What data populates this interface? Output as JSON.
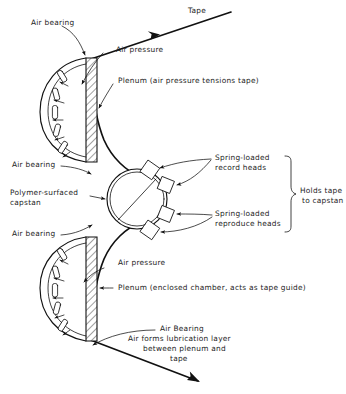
{
  "figure": {
    "background_color": "#ffffff",
    "ink_color": "#111111"
  },
  "labels": {
    "tape": "Tape",
    "air_bearing_top": "Air bearing",
    "air_pressure_top": "Air pressure",
    "plenum_top": "Plenum  (air pressure tensions tape)",
    "air_bearing_mid_upper": "Air bearing",
    "capstan": "Polymer-surfaced",
    "capstan_line2": "capstan",
    "air_bearing_mid_lower": "Air bearing",
    "record_heads_line1": "Spring-loaded",
    "record_heads_line2": "record heads",
    "reproduce_heads_line1": "Spring-loaded",
    "reproduce_heads_line2": "reproduce heads",
    "holds_tape_line1": "Holds tape",
    "holds_tape_line2": "to capstan",
    "air_pressure_bottom": "Air pressure",
    "plenum_bottom": "Plenum  (enclosed chamber, acts as tape guide)",
    "air_bearing_bottom_title": "Air Bearing",
    "air_bearing_bottom_l1": "Air forms lubrication layer",
    "air_bearing_bottom_l2": "between plenum and",
    "air_bearing_bottom_l3": "tape"
  },
  "components": {
    "upper_plenum": "hatched D-shaped chamber, upper",
    "lower_plenum": "hatched D-shaped chamber, lower",
    "capstan": "double-ring circle with diagonal line",
    "head_blocks": 4,
    "nozzle_slots_per_plenum": 4,
    "brace": "right-side curly brace grouping the four heads"
  }
}
